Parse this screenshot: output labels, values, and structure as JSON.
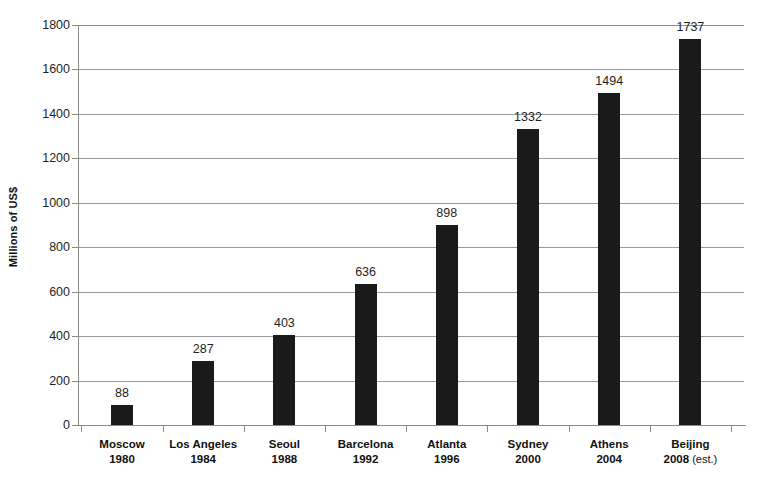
{
  "chart_data": {
    "type": "bar",
    "title": "",
    "subtitle": "",
    "xlabel": "",
    "ylabel": "Millions of US$",
    "ylim": [
      0,
      1800
    ],
    "ytick_step": 200,
    "yticks": [
      "0",
      "200",
      "400",
      "600",
      "800",
      "1000",
      "1200",
      "1400",
      "1600",
      "1800"
    ],
    "grid": true,
    "legend": false,
    "bar_color": "#1a1a1a",
    "gridline_color": "#9a9a9a",
    "axis_color": "#8a8a8a",
    "background_color": "#ffffff",
    "categories": [
      "Moscow 1980",
      "Los Angeles 1984",
      "Seoul 1988",
      "Barcelona 1992",
      "Atlanta 1996",
      "Sydney 2000",
      "Athens 2004",
      "Beijing 2008 (est.)"
    ],
    "values": [
      88,
      287,
      403,
      636,
      898,
      1332,
      1494,
      1737
    ],
    "points": [
      {
        "city": "Moscow",
        "year": "1980",
        "note": "",
        "value": 88,
        "label": "88"
      },
      {
        "city": "Los Angeles",
        "year": "1984",
        "note": "",
        "value": 287,
        "label": "287"
      },
      {
        "city": "Seoul",
        "year": "1988",
        "note": "",
        "value": 403,
        "label": "403"
      },
      {
        "city": "Barcelona",
        "year": "1992",
        "note": "",
        "value": 636,
        "label": "636"
      },
      {
        "city": "Atlanta",
        "year": "1996",
        "note": "",
        "value": 898,
        "label": "898"
      },
      {
        "city": "Sydney",
        "year": "2000",
        "note": "",
        "value": 1332,
        "label": "1332"
      },
      {
        "city": "Athens",
        "year": "2004",
        "note": "",
        "value": 1494,
        "label": "1494"
      },
      {
        "city": "Beijing",
        "year": "2008",
        "note": "(est.)",
        "value": 1737,
        "label": "1737"
      }
    ]
  }
}
